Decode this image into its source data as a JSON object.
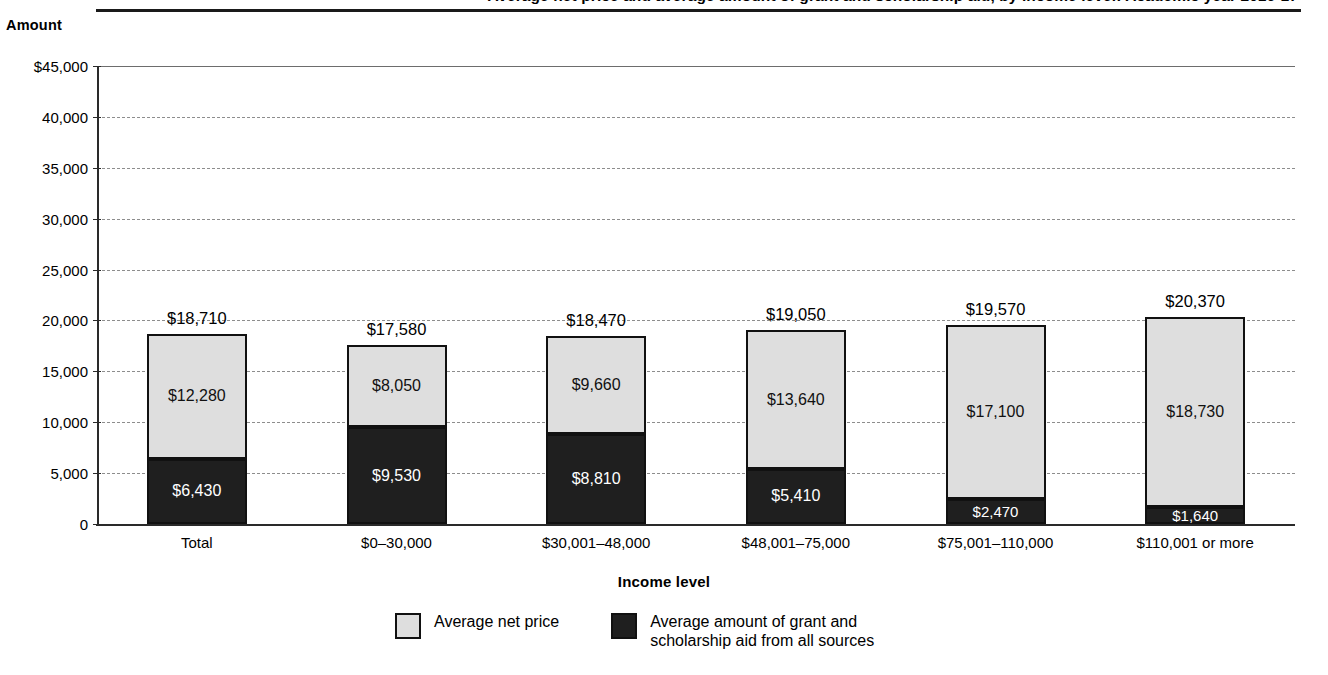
{
  "figure": {
    "title": "Average net price and average amount of grant and scholarship aid, by income level: Academic year 2016-17",
    "y_axis_caption": "Amount",
    "x_axis_title": "Income level"
  },
  "legend": {
    "items": [
      {
        "key": "net_price",
        "label": "Average net price",
        "color": "#dedede"
      },
      {
        "key": "grant_aid",
        "label": "Average amount of grant and\nscholarship aid from all sources",
        "color": "#1f1f1f"
      }
    ]
  },
  "chart_data": {
    "type": "bar",
    "stacked": true,
    "title": "Average net price and average amount of grant and scholarship aid, by income level: Academic year 2016-17",
    "xlabel": "Income level",
    "ylabel": "Amount",
    "ylim": [
      0,
      45000
    ],
    "ytick_step": 5000,
    "ytick_labels": [
      "$45,000",
      "40,000",
      "35,000",
      "30,000",
      "25,000",
      "20,000",
      "15,000",
      "10,000",
      "5,000",
      "0"
    ],
    "ytick_values": [
      45000,
      40000,
      35000,
      30000,
      25000,
      20000,
      15000,
      10000,
      5000,
      0
    ],
    "grid": true,
    "grid_style": "dashed-horizontal",
    "legend_position": "bottom",
    "categories": [
      "Total",
      "$0–30,000",
      "$30,001–48,000",
      "$48,001–75,000",
      "$75,001–110,000",
      "$110,001 or more"
    ],
    "series": [
      {
        "name": "Average amount of grant and scholarship aid from all sources",
        "color": "#1f1f1f",
        "values": [
          6430,
          9530,
          8810,
          5410,
          2470,
          1640
        ],
        "labels": [
          "$6,430",
          "$9,530",
          "$8,810",
          "$5,410",
          "$2,470",
          "$1,640"
        ]
      },
      {
        "name": "Average net price",
        "color": "#dedede",
        "values": [
          12280,
          8050,
          9660,
          13640,
          17100,
          18730
        ],
        "labels": [
          "$12,280",
          "$8,050",
          "$9,660",
          "$13,640",
          "$17,100",
          "$18,730"
        ]
      }
    ],
    "totals": [
      18710,
      17580,
      18470,
      19050,
      19570,
      20370
    ],
    "total_labels": [
      "$18,710",
      "$17,580",
      "$18,470",
      "$19,050",
      "$19,570",
      "$20,370"
    ]
  }
}
